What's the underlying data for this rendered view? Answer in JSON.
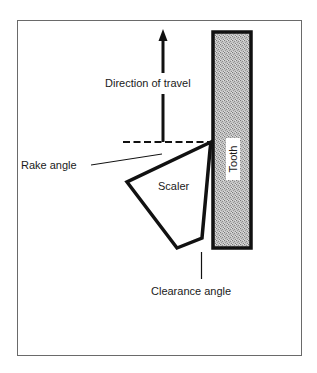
{
  "figure": {
    "labels": {
      "direction_of_travel": "Direction of travel",
      "rake_angle": "Rake angle",
      "scaler": "Scaler",
      "tooth": "Tooth",
      "clearance_angle": "Clearance angle"
    },
    "colors": {
      "stroke": "#111111",
      "frame": "#555555",
      "tooth_fill": "#b8b8b8",
      "background": "#ffffff"
    }
  }
}
